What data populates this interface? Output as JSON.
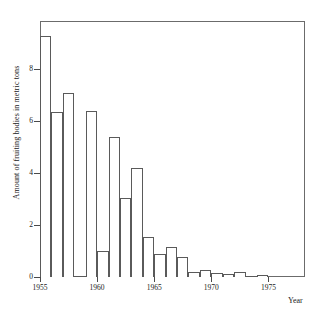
{
  "chart_data": {
    "type": "bar",
    "title": "",
    "xlabel": "Year",
    "ylabel": "Amount of fruiting bodies in metric tons",
    "xlim": [
      1955,
      1978.2
    ],
    "ylim": [
      0,
      9.85
    ],
    "grid": false,
    "legend": null,
    "bar_style": "histogram-outline",
    "xticks": [
      1955,
      1960,
      1965,
      1970,
      1975
    ],
    "xtick_labels": [
      "1955",
      "1960",
      "1965",
      "1970",
      "1975"
    ],
    "yticks": [
      0,
      2,
      4,
      6,
      8
    ],
    "ytick_labels": [
      "0",
      "2",
      "4",
      "6",
      "8"
    ],
    "categories": [
      1955,
      1956,
      1957,
      1958,
      1959,
      1960,
      1961,
      1962,
      1963,
      1964,
      1965,
      1966,
      1967,
      1968,
      1969,
      1970,
      1971,
      1972,
      1973,
      1974,
      1975
    ],
    "values": [
      9.27,
      6.35,
      7.08,
      0.04,
      6.4,
      1.0,
      5.4,
      3.05,
      4.2,
      1.55,
      0.88,
      1.15,
      0.77,
      0.2,
      0.27,
      0.15,
      0.12,
      0.2,
      0.03,
      0.08,
      0.0
    ]
  },
  "colors": {
    "bar_edge": "#5a5a5a",
    "bar_fill": "#ffffff",
    "frame": "#6b6b6b",
    "text": "#1b1b1b",
    "background": "#ffffff"
  }
}
